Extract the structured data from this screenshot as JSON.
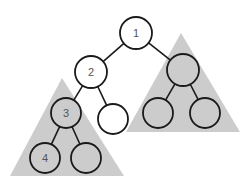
{
  "diagram": {
    "type": "binary-tree-subtrees",
    "colors": {
      "subtree_fill": "#cccccc",
      "node_stroke": "#1a1a1a",
      "empty_node_fill": "#ffffff",
      "label": "#555555"
    },
    "subtrees": [
      {
        "id": "left",
        "points": "62,78 10,176 124,176"
      },
      {
        "id": "right",
        "points": "181,33 126,132 240,132"
      }
    ],
    "nodes": [
      {
        "id": "n1",
        "label": "1",
        "cx": 136,
        "cy": 33,
        "r": 16,
        "shaded": false
      },
      {
        "id": "n2",
        "label": "2",
        "cx": 91,
        "cy": 72,
        "r": 16,
        "shaded": false
      },
      {
        "id": "n2r",
        "label": "",
        "cx": 113,
        "cy": 119,
        "r": 15,
        "shaded": false
      },
      {
        "id": "n3",
        "label": "3",
        "cx": 66,
        "cy": 113,
        "r": 15,
        "shaded": true
      },
      {
        "id": "n4",
        "label": "4",
        "cx": 45,
        "cy": 158,
        "r": 15,
        "shaded": true
      },
      {
        "id": "n3r",
        "label": "",
        "cx": 86,
        "cy": 158,
        "r": 15,
        "shaded": true
      },
      {
        "id": "nR",
        "label": "",
        "cx": 183,
        "cy": 70,
        "r": 16,
        "shaded": true
      },
      {
        "id": "nRL",
        "label": "",
        "cx": 158,
        "cy": 113,
        "r": 15,
        "shaded": true
      },
      {
        "id": "nRR",
        "label": "",
        "cx": 205,
        "cy": 113,
        "r": 15,
        "shaded": true
      }
    ],
    "edges": [
      [
        "n1",
        "n2"
      ],
      [
        "n1",
        "nR"
      ],
      [
        "n2",
        "n3"
      ],
      [
        "n2",
        "n2r"
      ],
      [
        "n3",
        "n4"
      ],
      [
        "n3",
        "n3r"
      ],
      [
        "nR",
        "nRL"
      ],
      [
        "nR",
        "nRR"
      ]
    ]
  }
}
